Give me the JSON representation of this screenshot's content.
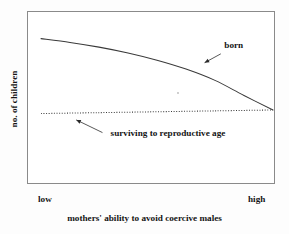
{
  "chart_data": {
    "type": "line",
    "title": "",
    "xlabel": "mothers' ability to avoid coercive males",
    "ylabel": "no. of children",
    "xticklabels": [
      "low",
      "high"
    ],
    "yticklabels": [],
    "grid": false,
    "legend_position": "inline-annotations",
    "xlim": [
      0,
      1
    ],
    "ylim": [
      0,
      1
    ],
    "series": [
      {
        "name": "born",
        "style": "solid",
        "x": [
          0.0,
          0.125,
          0.25,
          0.375,
          0.5,
          0.625,
          0.75,
          0.875,
          1.0
        ],
        "y": [
          0.885,
          0.855,
          0.818,
          0.772,
          0.715,
          0.645,
          0.556,
          0.437,
          0.323
        ]
      },
      {
        "name": "surviving to reproductive age",
        "style": "dotted",
        "x": [
          0.0,
          0.25,
          0.5,
          0.75,
          1.0
        ],
        "y": [
          0.295,
          0.302,
          0.309,
          0.316,
          0.323
        ]
      }
    ],
    "annotations": [
      {
        "label": "born",
        "text_x": 0.79,
        "text_y": 0.815,
        "arrow_from_x": 0.775,
        "arrow_from_y": 0.765,
        "arrow_to_x": 0.705,
        "arrow_to_y": 0.695
      },
      {
        "label": "surviving to reproductive age",
        "text_x": 0.3,
        "text_y": 0.115,
        "arrow_from_x": 0.265,
        "arrow_from_y": 0.145,
        "arrow_to_x": 0.152,
        "arrow_to_y": 0.245
      }
    ],
    "colors": {
      "background": "#ffffff",
      "frame": "#8a8a8a",
      "line": "#3a3a3a",
      "text": "#151515"
    }
  }
}
